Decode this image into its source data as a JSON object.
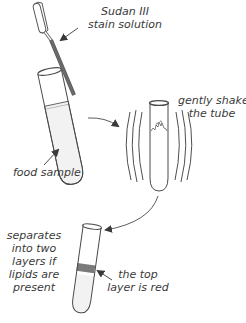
{
  "diagram": {
    "steps": [
      {
        "id": "step-1",
        "labels": {
          "stain_line1": "Sudan III",
          "stain_line2": "stain solution",
          "sample": "food sample"
        }
      },
      {
        "id": "step-2",
        "labels": {
          "shake_line1": "gently shake",
          "shake_line2": "the tube"
        }
      },
      {
        "id": "step-3",
        "labels": {
          "separates_line1": "separates",
          "separates_line2": "into two",
          "separates_line3": "layers if",
          "separates_line4": "lipids are",
          "separates_line5": "present",
          "red_line1": "the top",
          "red_line2": "layer is red"
        }
      }
    ],
    "colors": {
      "outline": "#4a4a4a",
      "liquid": "#f2f2f2",
      "pipette_stain": "#6a6a6a",
      "red_layer": "#7a7a7a",
      "text": "#3a3a3a"
    }
  }
}
